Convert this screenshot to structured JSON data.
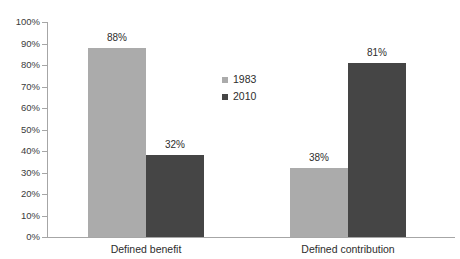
{
  "chart_data": {
    "type": "bar",
    "title": "",
    "xlabel": "",
    "ylabel": "",
    "categories": [
      "Defined benefit",
      "Defined contribution"
    ],
    "series": [
      {
        "name": "1983",
        "color": "#ababab",
        "values": [
          88,
          32
        ]
      },
      {
        "name": "2010",
        "color": "#454545",
        "values": [
          38,
          81
        ]
      }
    ],
    "value_labels": [
      [
        "88%",
        "32%"
      ],
      [
        "38%",
        "81%"
      ]
    ],
    "ylim": [
      0,
      100
    ],
    "ytick_values": [
      0,
      10,
      20,
      30,
      40,
      50,
      60,
      70,
      80,
      90,
      100
    ],
    "ytick_labels": [
      "0%",
      "10%",
      "20%",
      "30%",
      "40%",
      "50%",
      "60%",
      "70%",
      "80%",
      "90%",
      "100%"
    ],
    "grid": false,
    "legend_position": "center",
    "axis_color": "#a6a6a6",
    "text_color": "#2d2d2d"
  },
  "legend": {
    "entries": [
      {
        "label": "1983"
      },
      {
        "label": "2010"
      }
    ]
  }
}
